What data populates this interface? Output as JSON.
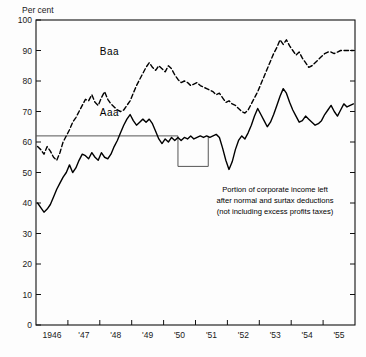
{
  "figure": {
    "ylabel": "Per cent",
    "series_labels": {
      "baa": "Baa",
      "aaa": "Aaa"
    },
    "note": {
      "line1": "Portion of corporate income left",
      "line2": "after normal and surtax deductions",
      "line3": "(not including excess profits taxes)"
    }
  },
  "chart_data": {
    "type": "line",
    "title": "",
    "subtitle": "",
    "xlabel": "",
    "ylabel": "Per cent",
    "ylim": [
      0,
      100
    ],
    "xlim": [
      1946.0,
      1956.0
    ],
    "grid": false,
    "legend_position": "inline-annotation",
    "ytick_labels": [
      "0",
      "10",
      "20",
      "30",
      "40",
      "50",
      "60",
      "70",
      "80",
      "90",
      "100"
    ],
    "ytick_values": [
      0,
      10,
      20,
      30,
      40,
      50,
      60,
      70,
      80,
      90,
      100
    ],
    "xtick_labels": [
      "1946",
      "'47",
      "'48",
      "'49",
      "'50",
      "'51",
      "'52",
      "'53",
      "'54",
      "'55"
    ],
    "xtick_values": [
      1946,
      1947,
      1948,
      1949,
      1950,
      1951,
      1952,
      1953,
      1954,
      1955
    ],
    "annotations": [
      {
        "text": "Baa",
        "x": 1948.3,
        "y": 88.5
      },
      {
        "text": "Aaa",
        "x": 1948.3,
        "y": 68.5
      },
      {
        "text": "Portion of corporate income left",
        "x": 1952.1,
        "y": 43.5
      },
      {
        "text": "after normal and surtax deductions",
        "x": 1952.1,
        "y": 39.7
      },
      {
        "text": "(not including excess profits taxes)",
        "x": 1952.1,
        "y": 35.9
      }
    ],
    "series": [
      {
        "name": "Baa",
        "style": "dashed",
        "x": [
          1946.05,
          1946.15,
          1946.25,
          1946.35,
          1946.45,
          1946.55,
          1946.65,
          1946.75,
          1946.85,
          1946.95,
          1947.05,
          1947.15,
          1947.25,
          1947.35,
          1947.45,
          1947.55,
          1947.65,
          1947.75,
          1947.85,
          1947.95,
          1948.05,
          1948.15,
          1948.25,
          1948.35,
          1948.45,
          1948.55,
          1948.65,
          1948.75,
          1948.85,
          1948.95,
          1949.05,
          1949.15,
          1949.25,
          1949.35,
          1949.45,
          1949.55,
          1949.65,
          1949.75,
          1949.85,
          1949.95,
          1950.05,
          1950.15,
          1950.25,
          1950.35,
          1950.45,
          1950.55,
          1950.65,
          1950.75,
          1950.85,
          1950.95,
          1951.05,
          1951.15,
          1951.25,
          1951.35,
          1951.45,
          1951.55,
          1951.65,
          1951.75,
          1951.85,
          1951.95,
          1952.05,
          1952.15,
          1952.25,
          1952.35,
          1952.45,
          1952.55,
          1952.65,
          1952.75,
          1952.85,
          1952.95,
          1953.05,
          1953.15,
          1953.25,
          1953.35,
          1953.45,
          1953.55,
          1953.65,
          1953.75,
          1953.85,
          1953.95,
          1954.05,
          1954.15,
          1954.25,
          1954.35,
          1954.45,
          1954.55,
          1954.65,
          1954.75,
          1954.85,
          1954.95,
          1955.05,
          1955.15,
          1955.25,
          1955.35,
          1955.45,
          1955.55,
          1955.65,
          1955.75,
          1955.85,
          1955.95
        ],
        "y": [
          58.5,
          57.5,
          56.0,
          58.5,
          57.0,
          55.0,
          54.0,
          56.5,
          60.0,
          62.0,
          64.0,
          66.5,
          68.0,
          70.0,
          72.0,
          74.0,
          73.5,
          75.5,
          73.0,
          72.0,
          74.5,
          76.5,
          74.0,
          72.5,
          71.5,
          70.5,
          70.0,
          70.5,
          72.0,
          73.5,
          76.0,
          78.5,
          80.5,
          82.5,
          84.5,
          86.0,
          84.5,
          83.5,
          85.0,
          84.0,
          83.0,
          85.0,
          84.0,
          82.0,
          80.5,
          79.5,
          80.0,
          79.5,
          78.5,
          79.0,
          79.5,
          78.5,
          78.0,
          77.5,
          77.0,
          76.5,
          75.5,
          76.0,
          74.5,
          73.0,
          73.5,
          72.5,
          72.0,
          71.0,
          70.0,
          69.5,
          70.5,
          72.5,
          74.5,
          76.5,
          79.0,
          81.5,
          84.0,
          86.5,
          89.0,
          91.0,
          93.5,
          92.0,
          93.5,
          91.5,
          90.0,
          88.5,
          89.5,
          87.5,
          86.0,
          84.5,
          85.0,
          86.0,
          87.0,
          88.0,
          89.0,
          89.5,
          89.5,
          89.0,
          89.5,
          90.0,
          90.0,
          90.0,
          90.0,
          90.0
        ]
      },
      {
        "name": "Aaa",
        "style": "solid",
        "x": [
          1946.05,
          1946.15,
          1946.25,
          1946.35,
          1946.45,
          1946.55,
          1946.65,
          1946.75,
          1946.85,
          1946.95,
          1947.05,
          1947.15,
          1947.25,
          1947.35,
          1947.45,
          1947.55,
          1947.65,
          1947.75,
          1947.85,
          1947.95,
          1948.05,
          1948.15,
          1948.25,
          1948.35,
          1948.45,
          1948.55,
          1948.65,
          1948.75,
          1948.85,
          1948.95,
          1949.05,
          1949.15,
          1949.25,
          1949.35,
          1949.45,
          1949.55,
          1949.65,
          1949.75,
          1949.85,
          1949.95,
          1950.05,
          1950.15,
          1950.25,
          1950.35,
          1950.45,
          1950.55,
          1950.65,
          1950.75,
          1950.85,
          1950.95,
          1951.05,
          1951.15,
          1951.25,
          1951.35,
          1951.45,
          1951.55,
          1951.65,
          1951.75,
          1951.85,
          1951.95,
          1952.05,
          1952.15,
          1952.25,
          1952.35,
          1952.45,
          1952.55,
          1952.65,
          1952.75,
          1952.85,
          1952.95,
          1953.05,
          1953.15,
          1953.25,
          1953.35,
          1953.45,
          1953.55,
          1953.65,
          1953.75,
          1953.85,
          1953.95,
          1954.05,
          1954.15,
          1954.25,
          1954.35,
          1954.45,
          1954.55,
          1954.65,
          1954.75,
          1954.85,
          1954.95,
          1955.05,
          1955.15,
          1955.25,
          1955.35,
          1955.45,
          1955.55,
          1955.65,
          1955.75,
          1955.85,
          1955.95
        ],
        "y": [
          40.0,
          38.5,
          37.0,
          38.0,
          39.5,
          42.0,
          44.5,
          46.5,
          48.5,
          50.0,
          52.5,
          50.0,
          51.5,
          54.0,
          56.0,
          55.5,
          54.5,
          56.5,
          55.0,
          54.0,
          56.5,
          55.0,
          54.5,
          56.0,
          58.5,
          60.5,
          63.0,
          65.5,
          67.5,
          69.0,
          67.0,
          65.5,
          66.5,
          67.5,
          66.5,
          67.5,
          66.0,
          63.5,
          61.0,
          59.5,
          61.0,
          60.0,
          61.5,
          60.5,
          61.5,
          60.5,
          61.5,
          61.0,
          62.0,
          61.0,
          61.5,
          62.0,
          61.5,
          62.0,
          61.5,
          62.0,
          62.5,
          61.5,
          58.0,
          54.0,
          51.0,
          53.5,
          57.5,
          60.5,
          62.0,
          61.0,
          63.0,
          65.5,
          68.5,
          71.0,
          69.0,
          67.0,
          65.0,
          66.5,
          69.0,
          72.0,
          75.0,
          77.5,
          76.0,
          73.0,
          70.5,
          68.5,
          66.5,
          67.0,
          68.5,
          67.5,
          66.5,
          65.5,
          66.0,
          67.0,
          69.0,
          70.5,
          72.0,
          70.0,
          68.5,
          70.5,
          72.5,
          71.5,
          72.0,
          72.5
        ]
      }
    ],
    "reference_steps": {
      "name": "statutory corporate income retained after tax",
      "style": "thin-solid-step",
      "segments": [
        {
          "x_start": 1946.0,
          "x_end": 1950.45,
          "y": 62.0
        },
        {
          "x_start": 1950.45,
          "x_end": 1951.4,
          "y": 52.0
        }
      ]
    }
  }
}
